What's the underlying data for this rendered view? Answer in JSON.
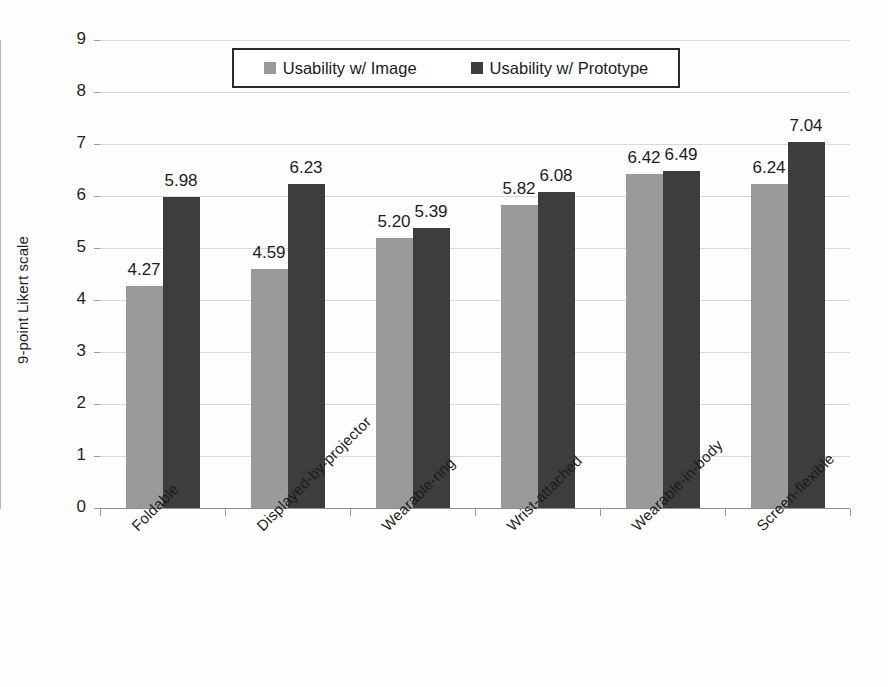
{
  "chart_data": {
    "type": "bar",
    "title": "",
    "xlabel": "",
    "ylabel": "9-point Likert scale",
    "ylim": [
      0,
      9
    ],
    "ytick_labels": [
      "9",
      "8",
      "7",
      "6",
      "5",
      "4",
      "3",
      "2",
      "1",
      "0"
    ],
    "yticks": [
      9,
      8,
      7,
      6,
      5,
      4,
      3,
      2,
      1,
      0
    ],
    "grid": true,
    "legend_position": "top-center",
    "categories": [
      "Foldable",
      "Displayed-by-projector",
      "Wearable-ring",
      "Wrist-attached",
      "Wearable-in-body",
      "Screen-flexible"
    ],
    "series": [
      {
        "name": "Usability w/ Image",
        "color": "#9a9a9a",
        "values": [
          4.27,
          4.59,
          5.2,
          5.82,
          6.42,
          6.24
        ],
        "labels": [
          "4.27",
          "4.59",
          "5.20",
          "5.82",
          "6.42",
          "6.24"
        ]
      },
      {
        "name": "Usability w/ Prototype",
        "color": "#3d3d3d",
        "values": [
          5.98,
          6.23,
          5.39,
          6.08,
          6.49,
          7.04
        ],
        "labels": [
          "5.98",
          "6.23",
          "5.39",
          "6.08",
          "6.49",
          "7.04"
        ]
      }
    ]
  },
  "legend": {
    "entries": [
      {
        "label": "Usability w/ Image",
        "swatch": "light"
      },
      {
        "label": "Usability w/ Prototype",
        "swatch": "dark"
      }
    ]
  },
  "colors": {
    "series_light": "#9a9a9a",
    "series_dark": "#3d3d3d",
    "gridline": "#d9d9d9",
    "axis": "#8f8f8f",
    "text": "#1c1c1c",
    "background": "#fefefe"
  }
}
